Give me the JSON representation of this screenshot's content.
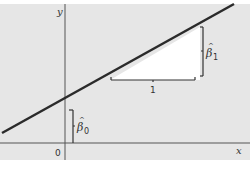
{
  "diagram": {
    "axes": {
      "x_label": "x",
      "y_label": "y",
      "origin_label": "0"
    },
    "annotations": {
      "intercept_label": "β̂0",
      "intercept_symbol": "β",
      "intercept_subscript": "0",
      "slope_label": "β̂1",
      "slope_symbol": "β",
      "slope_subscript": "1",
      "run_label": "1"
    },
    "colors": {
      "background": "#e6e6e6",
      "line": "#2b2b2b",
      "axis": "#555555",
      "triangle_fill": "#ffffff",
      "bracket": "#333333"
    }
  }
}
